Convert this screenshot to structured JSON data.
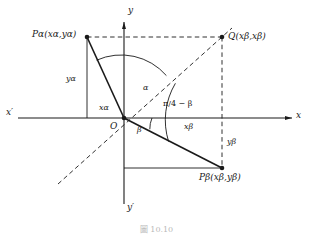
{
  "figure": {
    "caption": "圖    10.10",
    "background_color": "#ffffff",
    "line_color": "#1a1a1a"
  },
  "axes": {
    "x_negative_label": "x′",
    "x_positive_label": "x",
    "y_positive_label": "y",
    "y_negative_label": "y′",
    "origin_label": "O"
  },
  "points": {
    "p_alpha": {
      "name": "P",
      "subscript": "α",
      "coords": "(xα,yα)",
      "label_text": "Pα(xα,yα)"
    },
    "q": {
      "name": "Q",
      "coords": "(xβ,xβ)",
      "label_text": "Q(xβ,xβ)"
    },
    "p_beta": {
      "name": "P",
      "subscript": "β",
      "coords": "(xβ,yβ)",
      "label_text": "Pβ(xβ,yβ)"
    }
  },
  "segments": {
    "y_alpha": "yα",
    "x_alpha": "xα",
    "x_beta": "xβ",
    "y_beta": "yβ"
  },
  "angles": {
    "alpha": "α",
    "beta": "β",
    "pi_over_4_minus_beta": "π/4 − β"
  }
}
